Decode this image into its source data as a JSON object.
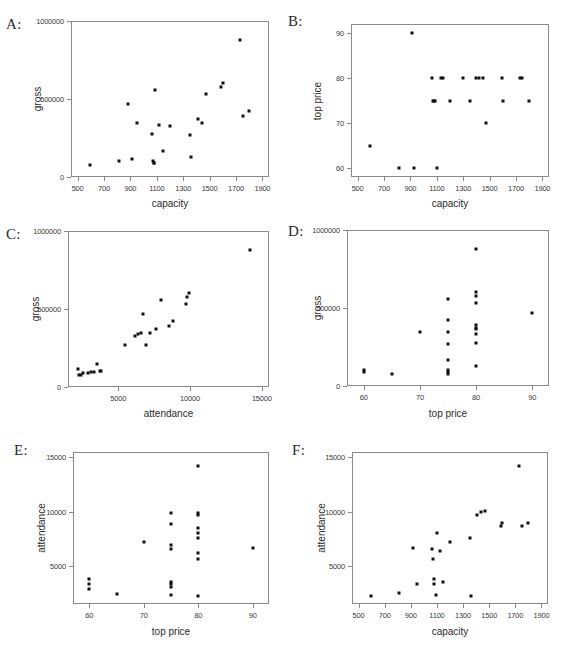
{
  "figure": {
    "title": "",
    "panel_label_suffix": ":",
    "point_color": "#111111",
    "axis_color": "#8a8a8a",
    "background": "#ffffff"
  },
  "chart_data": [
    {
      "type": "scatter",
      "panel": "A",
      "label": "A:",
      "title": "",
      "xlabel": "capacity",
      "ylabel": "gross",
      "xlim": [
        450,
        1950
      ],
      "ylim": [
        0,
        1000000
      ],
      "xticks": [
        500,
        700,
        900,
        1100,
        1300,
        1500,
        1700,
        1900
      ],
      "xticklabels": [
        "500",
        "700",
        "900",
        "1100",
        "1300",
        "1500",
        "1700",
        "1900"
      ],
      "yticks": [
        0,
        500000,
        1000000
      ],
      "yticklabels": [
        "0",
        "500000",
        "1000000"
      ],
      "grid": false,
      "legend": null,
      "x": [
        595,
        810,
        880,
        915,
        950,
        1060,
        1070,
        1075,
        1080,
        1090,
        1120,
        1150,
        1200,
        1350,
        1360,
        1410,
        1440,
        1470,
        1590,
        1600,
        1730,
        1750,
        1800
      ],
      "y": [
        78000,
        105000,
        470000,
        115000,
        345000,
        275000,
        100000,
        88000,
        92000,
        560000,
        335000,
        165000,
        330000,
        270000,
        130000,
        375000,
        345000,
        535000,
        575000,
        600000,
        880000,
        390000,
        420000
      ]
    },
    {
      "type": "scatter",
      "panel": "B",
      "label": "B:",
      "title": "",
      "xlabel": "capacity",
      "ylabel": "top price",
      "xlim": [
        450,
        1950
      ],
      "ylim": [
        58,
        92
      ],
      "xticks": [
        500,
        700,
        900,
        1100,
        1300,
        1500,
        1700,
        1900
      ],
      "xticklabels": [
        "500",
        "700",
        "900",
        "1100",
        "1300",
        "1500",
        "1700",
        "1900"
      ],
      "yticks": [
        60,
        70,
        80,
        90
      ],
      "yticklabels": [
        "60",
        "70",
        "80",
        "90"
      ],
      "grid": false,
      "legend": null,
      "x": [
        595,
        810,
        915,
        930,
        1060,
        1070,
        1080,
        1090,
        1100,
        1130,
        1150,
        1200,
        1300,
        1350,
        1400,
        1420,
        1450,
        1470,
        1595,
        1600,
        1730,
        1745,
        1800
      ],
      "y": [
        65,
        60,
        90,
        60,
        80,
        75,
        75,
        75,
        60,
        80,
        80,
        75,
        80,
        75,
        80,
        80,
        80,
        70,
        80,
        75,
        80,
        80,
        75
      ]
    },
    {
      "type": "scatter",
      "panel": "C",
      "label": "C:",
      "title": "",
      "xlabel": "attendance",
      "ylabel": "gross",
      "xlim": [
        1500,
        15500
      ],
      "ylim": [
        0,
        1000000
      ],
      "xticks": [
        5000,
        10000,
        15000
      ],
      "xticklabels": [
        "5000",
        "10000",
        "15000"
      ],
      "yticks": [
        0,
        500000,
        1000000
      ],
      "yticklabels": [
        "0",
        "500000",
        "1000000"
      ],
      "grid": false,
      "legend": null,
      "x": [
        2200,
        2300,
        2400,
        2550,
        2900,
        3100,
        3300,
        3500,
        3700,
        3800,
        5500,
        6200,
        6400,
        6600,
        6700,
        6900,
        7200,
        7600,
        8000,
        8500,
        8800,
        9700,
        9800,
        9900,
        14200
      ],
      "y": [
        115000,
        80000,
        78000,
        88000,
        92000,
        95000,
        98000,
        148000,
        100000,
        105000,
        272000,
        330000,
        340000,
        345000,
        470000,
        268000,
        345000,
        375000,
        560000,
        390000,
        420000,
        530000,
        575000,
        600000,
        880000
      ]
    },
    {
      "type": "scatter",
      "panel": "D",
      "label": "D:",
      "title": "",
      "xlabel": "top price",
      "ylabel": "gross",
      "xlim": [
        57,
        93
      ],
      "ylim": [
        0,
        1000000
      ],
      "xticks": [
        60,
        70,
        80,
        90
      ],
      "xticklabels": [
        "60",
        "70",
        "80",
        "90"
      ],
      "yticks": [
        0,
        500000,
        1000000
      ],
      "yticklabels": [
        "0",
        "500000",
        "1000000"
      ],
      "grid": false,
      "legend": null,
      "x": [
        60,
        60,
        65,
        70,
        75,
        75,
        75,
        75,
        75,
        75,
        75,
        75,
        80,
        80,
        80,
        80,
        80,
        80,
        80,
        80,
        80,
        80,
        90
      ],
      "y": [
        105000,
        92000,
        78000,
        345000,
        560000,
        420000,
        345000,
        268000,
        165000,
        100000,
        88000,
        80000,
        880000,
        600000,
        575000,
        530000,
        390000,
        375000,
        365000,
        335000,
        275000,
        130000,
        470000
      ]
    },
    {
      "type": "scatter",
      "panel": "E",
      "label": "E:",
      "title": "",
      "xlabel": "top price",
      "ylabel": "attendance",
      "xlim": [
        57,
        93
      ],
      "ylim": [
        1500,
        15500
      ],
      "xticks": [
        60,
        70,
        80,
        90
      ],
      "xticklabels": [
        "60",
        "70",
        "80",
        "90"
      ],
      "yticks": [
        5000,
        10000,
        15000
      ],
      "yticklabels": [
        "5000",
        "10000",
        "15000"
      ],
      "grid": false,
      "legend": null,
      "x": [
        60,
        60,
        60,
        65,
        70,
        75,
        75,
        75,
        75,
        75,
        75,
        75,
        75,
        80,
        80,
        80,
        80,
        80,
        80,
        80,
        80,
        80,
        90
      ],
      "y": [
        3800,
        3300,
        2900,
        2400,
        7200,
        9900,
        8900,
        6900,
        6600,
        3500,
        3300,
        3100,
        2300,
        14200,
        9900,
        9700,
        8500,
        8000,
        7600,
        6200,
        5600,
        2200,
        6700
      ]
    },
    {
      "type": "scatter",
      "panel": "F",
      "label": "F:",
      "title": "",
      "xlabel": "capacity",
      "ylabel": "attendance",
      "xlim": [
        450,
        1950
      ],
      "ylim": [
        1500,
        15500
      ],
      "xticks": [
        500,
        700,
        900,
        1100,
        1300,
        1500,
        1700,
        1900
      ],
      "xticklabels": [
        "500",
        "700",
        "900",
        "1100",
        "1300",
        "1500",
        "1700",
        "1900"
      ],
      "yticks": [
        5000,
        10000,
        15000
      ],
      "yticklabels": [
        "5000",
        "10000",
        "15000"
      ],
      "grid": false,
      "legend": null,
      "x": [
        595,
        810,
        915,
        950,
        1060,
        1070,
        1075,
        1080,
        1090,
        1100,
        1120,
        1150,
        1200,
        1350,
        1360,
        1410,
        1440,
        1470,
        1590,
        1600,
        1730,
        1750,
        1800
      ],
      "y": [
        2200,
        2550,
        6700,
        3300,
        6600,
        5600,
        3800,
        3300,
        2300,
        8000,
        6400,
        3500,
        7200,
        7600,
        2200,
        9700,
        10000,
        10050,
        8700,
        9000,
        14200,
        8700,
        9000
      ]
    }
  ]
}
